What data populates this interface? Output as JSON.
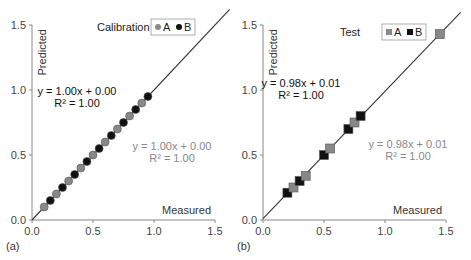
{
  "chart_data": [
    {
      "type": "scatter",
      "panel_label": "(a)",
      "title": "Calibration",
      "xlabel": "Measured",
      "ylabel": "Predicted",
      "xlim": [
        0,
        1.5
      ],
      "ylim": [
        0,
        1.5
      ],
      "xticks": [
        "0.0",
        "0.5",
        "1.0",
        "1.5"
      ],
      "yticks": [
        "0.0",
        "0.5",
        "1.0",
        "1.5"
      ],
      "grid": false,
      "legend": {
        "position": "top-right",
        "entries": [
          "A",
          "B"
        ],
        "marker": "circle"
      },
      "series": [
        {
          "name": "A",
          "color": "#888888",
          "x": [
            0.1,
            0.2,
            0.3,
            0.4,
            0.5,
            0.6,
            0.7,
            0.8,
            0.9
          ],
          "y": [
            0.1,
            0.2,
            0.3,
            0.4,
            0.5,
            0.6,
            0.7,
            0.8,
            0.9
          ]
        },
        {
          "name": "B",
          "color": "#111111",
          "x": [
            0.15,
            0.25,
            0.35,
            0.45,
            0.55,
            0.65,
            0.75,
            0.85,
            0.95
          ],
          "y": [
            0.15,
            0.25,
            0.35,
            0.45,
            0.55,
            0.65,
            0.75,
            0.85,
            0.95
          ]
        }
      ],
      "fit_line": {
        "slope": 1.0,
        "intercept": 0.0
      },
      "annotations": [
        {
          "series": "B",
          "equation": "y = 1.00x + 0.00",
          "r2": "R² = 1.00",
          "color": "#111111"
        },
        {
          "series": "A",
          "equation": "y = 1.00x + 0.00",
          "r2": "R² = 1.00",
          "color": "#888888"
        }
      ]
    },
    {
      "type": "scatter",
      "panel_label": "(b)",
      "title": "Test",
      "xlabel": "Measured",
      "ylabel": "Predicted",
      "xlim": [
        0,
        1.5
      ],
      "ylim": [
        0,
        1.5
      ],
      "xticks": [
        "0.0",
        "0.5",
        "1.0",
        "1.5"
      ],
      "yticks": [
        "0.0",
        "0.5",
        "1.0",
        "1.5"
      ],
      "grid": false,
      "legend": {
        "position": "top-right",
        "entries": [
          "A",
          "B"
        ],
        "marker": "square"
      },
      "series": [
        {
          "name": "A",
          "color": "#888888",
          "x": [
            0.25,
            0.35,
            0.55,
            0.75,
            1.45
          ],
          "y": [
            0.25,
            0.34,
            0.55,
            0.75,
            1.43
          ]
        },
        {
          "name": "B",
          "color": "#111111",
          "x": [
            0.2,
            0.3,
            0.5,
            0.7,
            0.8
          ],
          "y": [
            0.21,
            0.3,
            0.5,
            0.7,
            0.8
          ]
        }
      ],
      "fit_line": {
        "slope": 0.98,
        "intercept": 0.01
      },
      "annotations": [
        {
          "series": "B",
          "equation": "y = 0.98x + 0.01",
          "r2": "R² = 1.00",
          "color": "#111111"
        },
        {
          "series": "A",
          "equation": "y = 0.98x + 0.01",
          "r2": "R² = 1.00",
          "color": "#888888"
        }
      ]
    }
  ]
}
